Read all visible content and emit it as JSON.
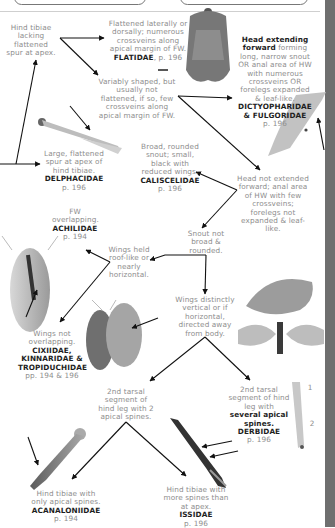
{
  "diagram": {
    "type": "identification-key",
    "nodes": [
      {
        "id": "hind-tibiae-lacking-spur",
        "text": "Hind tibiae lacking flattened spur at apex."
      },
      {
        "id": "flatidae",
        "text": "Flattened laterally or dorsally; numerous crossveins along apical margin of FW.",
        "family": "FLATIDAE",
        "page": "p. 196"
      },
      {
        "id": "variably-shaped",
        "text": "Variably shaped, but usually not flattened, if so, few crossveins along apical margin of FW."
      },
      {
        "id": "dictyopharidae-fulgoridae",
        "text_bold": "Head extending forward",
        "text": "forming long, narrow snout OR anal area of HW with numerous crossveins OR forelegs expanded & leaf-like.",
        "family": "DICTYOPHARIDAE & FULGORIDAE",
        "page": "p. 196"
      },
      {
        "id": "delphacidae",
        "text": "Large, flattened spur at apex of hind tibiae.",
        "family": "DELPHACIDAE",
        "page": "p. 196"
      },
      {
        "id": "caliscelidae",
        "text": "Broad, rounded snout; small, black with reduced wings.",
        "family": "CALISCELIDAE",
        "page": "p. 196"
      },
      {
        "id": "head-not-extended",
        "text": "Head not extended forward; anal area of HW with few crossveins; forelegs not expanded & leaf-like."
      },
      {
        "id": "achilidae",
        "text": "FW overlapping.",
        "family": "ACHILIDAE",
        "page": "p. 194"
      },
      {
        "id": "snout-not-broad",
        "text": "Snout not broad & rounded."
      },
      {
        "id": "wings-roof-like",
        "text": "Wings held roof-like or nearly horizontal."
      },
      {
        "id": "cixiidae-group",
        "text": "Wings not overlapping.",
        "family": "CIXIIDAE, KINNARIDAE & TROPIDUCHIDAE",
        "page": "pp. 194 & 196"
      },
      {
        "id": "wings-vertical",
        "text": "Wings distinctly vertical or if horizontal, directed away from body."
      },
      {
        "id": "tarsal-2-spines",
        "text": "2nd tarsal segment of hind leg with 2 apical spines."
      },
      {
        "id": "derbidae",
        "text": "2nd tarsal segment of hind leg with",
        "text_bold": "several apical spines.",
        "family": "DERBIDAE",
        "page": "p. 196"
      },
      {
        "id": "acanaloniidae",
        "text": "Hind tibiae with only apical spines.",
        "family": "ACANALONIIDAE",
        "page": "p. 194"
      },
      {
        "id": "issidae",
        "text": "Hind tibiae with more spines than at apex.",
        "family": "ISSIDAE",
        "page": "p. 196"
      }
    ],
    "edges": [
      [
        "hind-tibiae-lacking-spur",
        "flatidae"
      ],
      [
        "hind-tibiae-lacking-spur",
        "variably-shaped"
      ],
      [
        "variably-shaped",
        "dictyopharidae-fulgoridae"
      ],
      [
        "variably-shaped",
        "head-not-extended"
      ],
      [
        "head-not-extended",
        "caliscelidae"
      ],
      [
        "head-not-extended",
        "snout-not-broad"
      ],
      [
        "snout-not-broad",
        "wings-vertical"
      ],
      [
        "wings-vertical",
        "tarsal-2-spines"
      ],
      [
        "wings-vertical",
        "derbidae"
      ],
      [
        "tarsal-2-spines",
        "acanaloniidae"
      ],
      [
        "tarsal-2-spines",
        "issidae"
      ],
      [
        "wings-roof-like",
        "achilidae"
      ],
      [
        "wings-roof-like",
        "cixiidae-group"
      ]
    ],
    "image_labels": {
      "derbidae_leg_1": "1",
      "derbidae_leg_2": "2"
    }
  }
}
